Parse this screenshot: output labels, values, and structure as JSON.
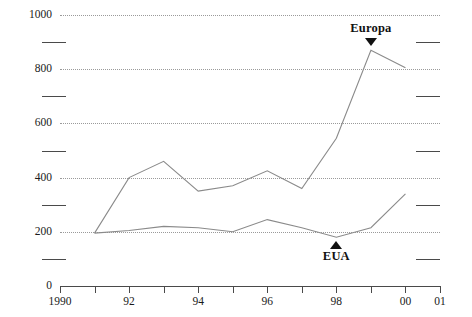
{
  "chart_data": {
    "type": "line",
    "title": "",
    "xlabel": "",
    "ylabel": "",
    "xlim": [
      1990,
      2001
    ],
    "ylim": [
      0,
      1000
    ],
    "grid": true,
    "legend_position": "inline-annotations",
    "y_ticks": [
      "0",
      "200",
      "400",
      "600",
      "800",
      "1000"
    ],
    "y_tick_values": [
      0,
      200,
      400,
      600,
      800,
      1000
    ],
    "y_minor_tick_values": [
      100,
      300,
      500,
      700,
      900
    ],
    "x_ticks": [
      "1990",
      "92",
      "94",
      "96",
      "98",
      "00",
      "01"
    ],
    "x_tick_values": [
      1990,
      1992,
      1994,
      1996,
      1998,
      2000,
      2001
    ],
    "x_all_tick_values": [
      1990,
      1991,
      1992,
      1993,
      1994,
      1995,
      1996,
      1997,
      1998,
      1999,
      2000,
      2001
    ],
    "x": [
      1991,
      1992,
      1993,
      1994,
      1995,
      1996,
      1997,
      1998,
      1999,
      2000
    ],
    "series": [
      {
        "name": "Europa",
        "values": [
          195,
          400,
          460,
          350,
          370,
          425,
          360,
          545,
          870,
          805
        ]
      },
      {
        "name": "EUA",
        "values": [
          195,
          205,
          220,
          215,
          200,
          245,
          215,
          180,
          215,
          340
        ]
      }
    ],
    "annotations": [
      {
        "label": "Europa",
        "arrow": "down",
        "points_at_year": 1999,
        "points_at_value": 870
      },
      {
        "label": "EUA",
        "arrow": "up",
        "points_at_year": 1998,
        "points_at_value": 180
      }
    ]
  }
}
